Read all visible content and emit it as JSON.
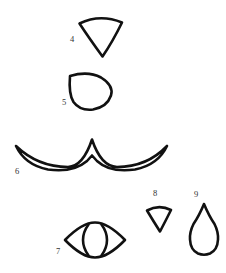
{
  "canvas": {
    "width": 226,
    "height": 273,
    "background_color": "#ffffff",
    "ink_color": "#111111",
    "label_color": "#333333",
    "description": "Black ink line drawing of six numbered outline shapes on a plain white background"
  },
  "figures": [
    {
      "id": "figure-4",
      "label": "4",
      "shape_name": "inverted-curved-wedge",
      "description": "Downward pointing wedge / pie sector with gently arched top edge",
      "label_position": {
        "x": 72,
        "y": 40
      },
      "bounds": {
        "x": 78,
        "y": 15,
        "width": 45,
        "height": 42
      },
      "stroke_width": 2.6,
      "path": "M 79.5 23.5 Q 100 13.5 122 22.5 Q 112.5 42 102.5 56.5 Q 89 38 79.5 23.5 Z"
    },
    {
      "id": "figure-5",
      "label": "5",
      "shape_name": "teardrop-point-upper-left",
      "description": "Egg or teardrop outline with its point at the upper left",
      "label_position": {
        "x": 64,
        "y": 103
      },
      "bounds": {
        "x": 68,
        "y": 72,
        "width": 45,
        "height": 38
      },
      "stroke_width": 2.6,
      "path": "M 70 76 Q 88 70.5 101 77.5 Q 114 85.5 111 95.5 Q 107 107 93 109.5 Q 80 111 73.5 102 Q 68.5 94 70 76 Z"
    },
    {
      "id": "figure-6",
      "label": "6",
      "shape_name": "double-curve-wing",
      "description": "Long narrow crescent band sweeping down on both sides from a central peak, like a bird wing or moustache",
      "label_position": {
        "x": 17,
        "y": 172
      },
      "bounds": {
        "x": 14,
        "y": 137,
        "width": 155,
        "height": 32
      },
      "stroke_width": 2.6,
      "path": "M 16 146 Q 38 167 68 167 Q 83 166.5 92 139.5 Q 101 166.5 117 167 Q 147 167 167 146 Q 158 165 135 169.5 Q 110 173 97 161 L 92 155.5 L 87 161 Q 73 173 48 169.5 Q 25 165 16 146 Z"
    },
    {
      "id": "figure-7",
      "label": "7",
      "shape_name": "eye-with-inner-lens",
      "description": "Horizontal eye or lens outline containing a narrow vertical lens shape at its centre",
      "label_position": {
        "x": 58,
        "y": 252
      },
      "bounds": {
        "x": 64,
        "y": 222,
        "width": 62,
        "height": 36
      },
      "stroke_width": 2.6,
      "outer_path": "M 65 240 Q 82 222.5 95 222.5 Q 108 222.5 125 240 Q 108 257.5 95 257.5 Q 82 257.5 65 240 Z",
      "inner_path": "M 95 223 Q 86 231 86 240 Q 86 249 95 257 Q 104 249 104 240 Q 104 231 95 223 Z",
      "inner_line_left": "M 88.5 224.5 Q 83 232 83 240 Q 83 248 88.5 255.5",
      "inner_line_right": "M 101.5 224.5 Q 107 232 107 240 Q 107 248 101.5 255.5"
    },
    {
      "id": "figure-8",
      "label": "8",
      "shape_name": "small-inverted-curved-wedge",
      "description": "Small downward pointing wedge with arched top, a reduced version of figure 4",
      "label_position": {
        "x": 155,
        "y": 194
      },
      "bounds": {
        "x": 146,
        "y": 205,
        "width": 26,
        "height": 27
      },
      "stroke_width": 2.6,
      "path": "M 147 210.5 Q 159 204 171 210 Q 165.5 221 160 231.5 Q 153 220.5 147 210.5 Z"
    },
    {
      "id": "figure-9",
      "label": "9",
      "shape_name": "teardrop-point-up",
      "description": "Water drop outline with a sharp point at the top and a round bulb at the bottom",
      "label_position": {
        "x": 196,
        "y": 195
      },
      "bounds": {
        "x": 190,
        "y": 203,
        "width": 28,
        "height": 52
      },
      "stroke_width": 2.6,
      "path": "M 204 204 Q 199 216 193.5 224 Q 189.5 232 190 239.5 Q 190.5 250 198 253.5 Q 204 256 210 253.5 Q 217.5 250 218 239.5 Q 218.5 232 214.5 224 Q 209 216 204 204 Z"
    }
  ]
}
